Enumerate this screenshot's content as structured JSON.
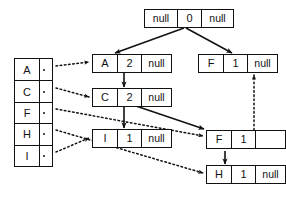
{
  "diagram": {
    "colors": {
      "stroke": "#111111",
      "background": "#ffffff"
    },
    "index_table": {
      "name": "index-table",
      "pointer_marker": "•",
      "rows": [
        {
          "key": "A",
          "pointer": "•"
        },
        {
          "key": "C",
          "pointer": "•"
        },
        {
          "key": "F",
          "pointer": "•"
        },
        {
          "key": "H",
          "pointer": "•"
        },
        {
          "key": "I",
          "pointer": "•"
        }
      ]
    },
    "nodes": [
      {
        "id": "root",
        "key": "null",
        "count": "0",
        "next": "null"
      },
      {
        "id": "a",
        "key": "A",
        "count": "2",
        "next": "null"
      },
      {
        "id": "f-top",
        "key": "F",
        "count": "1",
        "next": "null"
      },
      {
        "id": "c",
        "key": "C",
        "count": "2",
        "next": "null"
      },
      {
        "id": "i",
        "key": "I",
        "count": "1",
        "next": "null"
      },
      {
        "id": "f-mid",
        "key": "F",
        "count": "1",
        "next": ""
      },
      {
        "id": "h",
        "key": "H",
        "count": "1",
        "next": "null"
      }
    ],
    "edges": [
      {
        "from": "root",
        "to": "a",
        "style": "solid",
        "label": "root-to-a"
      },
      {
        "from": "root",
        "to": "f-top",
        "style": "solid",
        "label": "root-to-f-top"
      },
      {
        "from": "a",
        "to": "c",
        "style": "solid",
        "label": "a-to-c"
      },
      {
        "from": "c",
        "to": "i",
        "style": "solid",
        "label": "c-to-i"
      },
      {
        "from": "c",
        "to": "f-mid",
        "style": "solid",
        "label": "c-to-f-mid"
      },
      {
        "from": "f-mid",
        "to": "h",
        "style": "solid",
        "label": "f-mid-to-h"
      },
      {
        "from": "f-mid",
        "to": "f-top",
        "style": "dotted",
        "label": "f-mid-to-f-top"
      },
      {
        "from": "table-row-A",
        "to": "a",
        "style": "dotted",
        "label": "a-index-to-a"
      },
      {
        "from": "table-row-C",
        "to": "c",
        "style": "dotted",
        "label": "c-index-to-c"
      },
      {
        "from": "table-row-F",
        "to": "f-mid",
        "style": "dotted",
        "label": "f-index-to-f-mid"
      },
      {
        "from": "table-row-H",
        "to": "h",
        "style": "dotted",
        "label": "h-index-to-h"
      },
      {
        "from": "table-row-I",
        "to": "i",
        "style": "dotted",
        "label": "i-index-to-i"
      }
    ]
  }
}
